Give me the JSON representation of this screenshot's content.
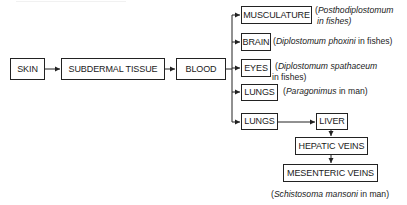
{
  "diagram": {
    "type": "flowchart",
    "main_chain": [
      "SKIN",
      "SUBDERMAL TISSUE",
      "BLOOD"
    ],
    "branches": [
      {
        "node": "MUSCULATURE",
        "note_italic": "Posthodiplostomum",
        "note_line2": "in fishes)",
        "note_prefix": "(",
        "note_suffix": ""
      },
      {
        "node": "BRAIN",
        "note_prefix": "(",
        "note_italic": "Diplostomum phoxini",
        "note_suffix": " in fishes)"
      },
      {
        "node": "EYES",
        "note_prefix": "(",
        "note_italic": "Diplostomum spathaceum",
        "note_line2": "in fishes)"
      },
      {
        "node": "LUNGS",
        "note_prefix": "(",
        "note_italic": "Paragonimus",
        "note_suffix": " in man)"
      },
      {
        "node": "LUNGS",
        "chain": [
          "LIVER",
          "HEPATIC VEINS",
          "MESENTERIC VEINS"
        ]
      }
    ],
    "caption": {
      "prefix": "(",
      "italic": "Schistosoma mansoni",
      "suffix": " in man)"
    }
  },
  "nodes": {
    "skin": "SKIN",
    "subdermal": "SUBDERMAL TISSUE",
    "blood": "BLOOD",
    "musculature": "MUSCULATURE",
    "brain": "BRAIN",
    "eyes": "EYES",
    "lungs1": "LUNGS",
    "lungs2": "LUNGS",
    "liver": "LIVER",
    "hepatic": "HEPATIC VEINS",
    "mesenteric": "MESENTERIC VEINS"
  },
  "notes": {
    "musculature": {
      "open": "(",
      "italic": "Posthodiplostomum",
      "line2": "in fishes)"
    },
    "brain": {
      "open": "(",
      "italic": "Diplostomum phoxini",
      "tail": " in fishes)"
    },
    "eyes": {
      "open": "(",
      "italic": "Diplostomum spathaceum",
      "line2": "in fishes)"
    },
    "lungs1": {
      "open": "(",
      "italic": "Paragonimus",
      "tail": " in man)"
    },
    "mesenteric": {
      "open": "(",
      "italic": "Schistosoma mansoni",
      "tail": " in man)"
    }
  }
}
